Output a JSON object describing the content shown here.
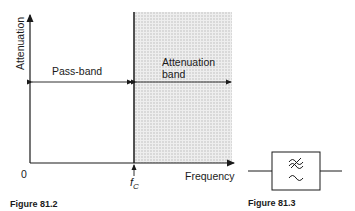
{
  "figure_left": {
    "caption": "Figure 81.2",
    "y_axis_label": "Attenuation",
    "x_axis_label": "Frequency",
    "origin_label": "0",
    "cutoff_label": "f",
    "cutoff_subscript": "C",
    "regions": [
      {
        "label": "Pass-band",
        "shaded": false
      },
      {
        "label_line1": "Attenuation",
        "label_line2": "band",
        "shaded": true
      }
    ],
    "colors": {
      "line": "#1a1a1a",
      "shade": "#d9d9d9"
    }
  },
  "figure_right": {
    "caption": "Figure 81.3",
    "symbol": "low-pass filter block",
    "glyph_top": "≈",
    "glyph_bottom": "∼"
  }
}
